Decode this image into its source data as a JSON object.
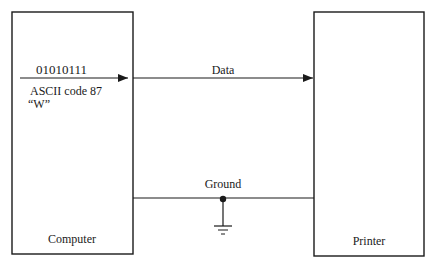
{
  "diagram": {
    "computer": {
      "label": "Computer"
    },
    "printer": {
      "label": "Printer"
    },
    "data_line": {
      "label": "Data",
      "binary": "01010111",
      "ascii_text": "ASCII code 87",
      "character": "“W”"
    },
    "ground_line": {
      "label": "Ground"
    }
  }
}
